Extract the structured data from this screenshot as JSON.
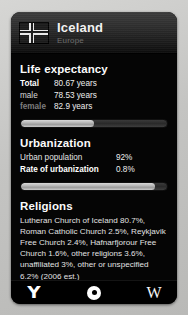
{
  "card": {
    "header": {
      "flag_icon": "iceland-flag-icon",
      "country": "Iceland",
      "region": "Europe"
    },
    "sections": [
      {
        "id": "life-expectancy",
        "title": "Life expectancy",
        "rows": [
          {
            "label": "Total",
            "value": "80.67 years"
          },
          {
            "label": "male",
            "value": "78.53 years"
          },
          {
            "label": "female",
            "value": "82.9 years"
          }
        ],
        "bar_percent": 50
      },
      {
        "id": "urbanization",
        "title": "Urbanization",
        "rows": [
          {
            "label": "Urban population",
            "value": "92%"
          },
          {
            "label": "Rate of urbanization",
            "value": "0.8%"
          }
        ],
        "bar_percent": 92
      },
      {
        "id": "religions",
        "title": "Religions",
        "text": "Lutheran Church of Iceland 80.7%, Roman Catholic Church 2.5%, Reykjavik Free Church 2.4%, Hafnarfjorour Free Church 1.6%, other religions 3.6%, unaffiliated 3%, other or unspecified 6.2% (2006 est.)"
      }
    ]
  },
  "toolbar": {
    "buttons": [
      {
        "id": "bookmark",
        "icon": "y-bookmark-icon",
        "glyph": "Y"
      },
      {
        "id": "locate",
        "icon": "target-dot-icon",
        "glyph": ""
      },
      {
        "id": "wikipedia",
        "icon": "wikipedia-w-icon",
        "glyph": "W"
      }
    ]
  },
  "colors": {
    "card_bg": "#050505",
    "header_top": "#3b3b3b",
    "accent_text": "#ffffff",
    "dim_text": "#7d7d7d",
    "bar_fill": "#c9c9c9",
    "page_bg": "#c9c9c7"
  }
}
